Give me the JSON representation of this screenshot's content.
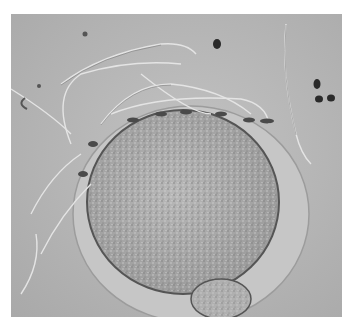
{
  "image": {
    "subject": "Microscopy image of sperm cells surrounding an oocyte (egg cell) with zona pellucida and polar body",
    "colors": {
      "background": "#b4b4b4",
      "border": "#ffffff",
      "oocyte": "#a9a9a9",
      "zona": "#c4c4c4",
      "dark_spot": "#2a2a2a"
    }
  }
}
